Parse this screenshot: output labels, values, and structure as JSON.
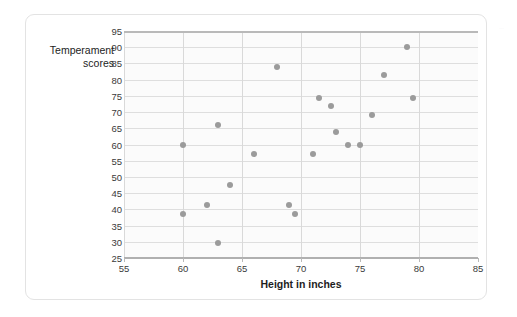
{
  "figure": {
    "edge_text_fragment": "…"
  },
  "chart_data": {
    "type": "scatter",
    "title": "",
    "xlabel": "Height in inches",
    "ylabel": "Temperament scores",
    "xlim": [
      55,
      85
    ],
    "ylim": [
      25,
      95
    ],
    "xticks": [
      55,
      60,
      65,
      70,
      75,
      80,
      85
    ],
    "yticks": [
      25,
      30,
      35,
      40,
      45,
      50,
      55,
      60,
      65,
      70,
      75,
      80,
      85,
      90,
      95
    ],
    "grid": true,
    "legend": "none",
    "point_color": "#9b9b9b",
    "gridline_color": "#dedede",
    "points": [
      {
        "x": 60.0,
        "y": 60.0
      },
      {
        "x": 60.0,
        "y": 38.5
      },
      {
        "x": 62.0,
        "y": 41.5
      },
      {
        "x": 63.0,
        "y": 66.0
      },
      {
        "x": 63.0,
        "y": 29.5
      },
      {
        "x": 64.0,
        "y": 47.5
      },
      {
        "x": 66.0,
        "y": 57.0
      },
      {
        "x": 68.0,
        "y": 84.0
      },
      {
        "x": 69.0,
        "y": 41.5
      },
      {
        "x": 69.5,
        "y": 38.5
      },
      {
        "x": 71.0,
        "y": 57.0
      },
      {
        "x": 71.5,
        "y": 74.5
      },
      {
        "x": 72.5,
        "y": 72.0
      },
      {
        "x": 73.0,
        "y": 64.0
      },
      {
        "x": 74.0,
        "y": 60.0
      },
      {
        "x": 75.0,
        "y": 60.0
      },
      {
        "x": 76.0,
        "y": 69.0
      },
      {
        "x": 77.0,
        "y": 81.5
      },
      {
        "x": 79.0,
        "y": 90.0
      },
      {
        "x": 79.5,
        "y": 74.5
      }
    ]
  }
}
